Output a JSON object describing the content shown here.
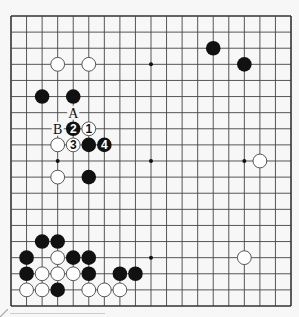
{
  "board": {
    "size": 19,
    "origin_x": 11,
    "origin_y": 16,
    "spacing_x": 15.556,
    "spacing_y": 16.111,
    "stone_radius": 7.3,
    "colors": {
      "background": "#f7f7f7",
      "line": "#444444",
      "edge": "#333333",
      "black_stone": "#111111",
      "white_stone": "#ffffff",
      "white_stone_border": "#444444"
    },
    "star_points": [
      [
        3,
        3
      ],
      [
        9,
        3
      ],
      [
        15,
        3
      ],
      [
        3,
        9
      ],
      [
        9,
        9
      ],
      [
        15,
        9
      ],
      [
        3,
        15
      ],
      [
        9,
        15
      ],
      [
        15,
        15
      ]
    ]
  },
  "stones": [
    {
      "color": "white",
      "col": 3,
      "row": 3
    },
    {
      "color": "white",
      "col": 5,
      "row": 3
    },
    {
      "color": "black",
      "col": 13,
      "row": 2
    },
    {
      "color": "black",
      "col": 15,
      "row": 3
    },
    {
      "color": "black",
      "col": 2,
      "row": 5
    },
    {
      "color": "black",
      "col": 4,
      "row": 5
    },
    {
      "color": "black",
      "col": 4,
      "row": 7,
      "label": "2"
    },
    {
      "color": "white",
      "col": 5,
      "row": 7,
      "label": "1"
    },
    {
      "color": "white",
      "col": 3,
      "row": 8
    },
    {
      "color": "white",
      "col": 4,
      "row": 8,
      "label": "3"
    },
    {
      "color": "black",
      "col": 5,
      "row": 8
    },
    {
      "color": "black",
      "col": 6,
      "row": 8,
      "label": "4"
    },
    {
      "color": "white",
      "col": 3,
      "row": 10
    },
    {
      "color": "black",
      "col": 5,
      "row": 10
    },
    {
      "color": "white",
      "col": 16,
      "row": 9
    },
    {
      "color": "white",
      "col": 15,
      "row": 15
    },
    {
      "color": "black",
      "col": 2,
      "row": 14
    },
    {
      "color": "black",
      "col": 3,
      "row": 14
    },
    {
      "color": "black",
      "col": 1,
      "row": 15
    },
    {
      "color": "white",
      "col": 3,
      "row": 15
    },
    {
      "color": "black",
      "col": 4,
      "row": 15
    },
    {
      "color": "black",
      "col": 5,
      "row": 15
    },
    {
      "color": "black",
      "col": 1,
      "row": 16
    },
    {
      "color": "white",
      "col": 2,
      "row": 16
    },
    {
      "color": "white",
      "col": 3,
      "row": 16
    },
    {
      "color": "white",
      "col": 4,
      "row": 16
    },
    {
      "color": "black",
      "col": 5,
      "row": 16
    },
    {
      "color": "black",
      "col": 7,
      "row": 16
    },
    {
      "color": "black",
      "col": 8,
      "row": 16
    },
    {
      "color": "white",
      "col": 1,
      "row": 17
    },
    {
      "color": "white",
      "col": 2,
      "row": 17
    },
    {
      "color": "black",
      "col": 3,
      "row": 17
    },
    {
      "color": "white",
      "col": 5,
      "row": 17
    },
    {
      "color": "white",
      "col": 6,
      "row": 17
    },
    {
      "color": "white",
      "col": 7,
      "row": 17
    }
  ],
  "point_labels": [
    {
      "text": "A",
      "col": 4,
      "row": 6
    },
    {
      "text": "B",
      "col": 3,
      "row": 7
    }
  ]
}
